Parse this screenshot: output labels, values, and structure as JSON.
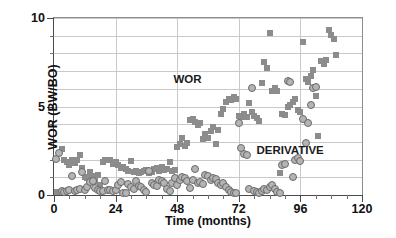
{
  "chart_data": {
    "type": "scatter",
    "title": "",
    "xlabel": "Time (months)",
    "ylabel": "WOR (BW/BO)",
    "xlim": [
      0,
      120
    ],
    "ylim": [
      0,
      10
    ],
    "xticks": [
      0,
      24,
      48,
      72,
      96,
      120
    ],
    "xticklabels": [
      "0",
      "24",
      "48",
      "72",
      "96",
      "120"
    ],
    "xminor_step": 6,
    "yticks": [
      0,
      5,
      10
    ],
    "yticklabels": [
      "0",
      "5",
      "10"
    ],
    "yminor_step": 1,
    "grid": true,
    "grid_axis": "both",
    "legend": "none",
    "annotations": [
      {
        "text": "WOR",
        "x": 52,
        "y": 6.55
      },
      {
        "text": "DERIVATIVE",
        "x": 92,
        "y": 2.55
      }
    ],
    "series": [
      {
        "name": "WOR",
        "marker": "square",
        "color": "#8c8c8c",
        "points": [
          [
            1.0,
            0.18
          ],
          [
            2.0,
            2.35
          ],
          [
            3.0,
            2.6
          ],
          [
            4.0,
            1.95
          ],
          [
            5.0,
            1.85
          ],
          [
            6.0,
            1.7
          ],
          [
            7.0,
            1.98
          ],
          [
            8.0,
            1.8
          ],
          [
            9.0,
            2.0
          ],
          [
            10.0,
            2.25
          ],
          [
            11.0,
            1.55
          ],
          [
            12.0,
            1.0
          ],
          [
            13.0,
            0.95
          ],
          [
            14.0,
            1.3
          ],
          [
            15.0,
            1.05
          ],
          [
            16.0,
            0.8
          ],
          [
            17.0,
            1.15
          ],
          [
            18.0,
            0.55
          ],
          [
            19.0,
            1.85
          ],
          [
            20.0,
            1.95
          ],
          [
            21.0,
            2.0
          ],
          [
            22.0,
            1.95
          ],
          [
            23.0,
            1.75
          ],
          [
            24.0,
            1.85
          ],
          [
            25.0,
            1.7
          ],
          [
            26.0,
            1.55
          ],
          [
            27.0,
            1.6
          ],
          [
            28.0,
            1.45
          ],
          [
            29.0,
            1.35
          ],
          [
            30.0,
            1.9
          ],
          [
            31.0,
            1.3
          ],
          [
            32.0,
            1.35
          ],
          [
            33.0,
            1.25
          ],
          [
            34.0,
            1.3
          ],
          [
            35.0,
            1.35
          ],
          [
            36.0,
            1.4
          ],
          [
            37.0,
            1.25
          ],
          [
            38.0,
            1.3
          ],
          [
            39.0,
            1.45
          ],
          [
            40.0,
            1.5
          ],
          [
            41.0,
            1.35
          ],
          [
            42.0,
            1.6
          ],
          [
            43.0,
            1.4
          ],
          [
            44.0,
            1.45
          ],
          [
            45.0,
            1.85
          ],
          [
            46.0,
            1.35
          ],
          [
            47.0,
            1.4
          ],
          [
            48.0,
            2.7
          ],
          [
            49.0,
            2.9
          ],
          [
            50.0,
            3.2
          ],
          [
            51.0,
            2.75
          ],
          [
            52.0,
            2.95
          ],
          [
            53.0,
            4.25
          ],
          [
            54.0,
            4.3
          ],
          [
            55.0,
            4.1
          ],
          [
            56.0,
            3.95
          ],
          [
            57.0,
            4.05
          ],
          [
            58.0,
            3.15
          ],
          [
            59.0,
            3.45
          ],
          [
            60.0,
            3.2
          ],
          [
            61.0,
            3.6
          ],
          [
            62.0,
            3.85
          ],
          [
            63.0,
            2.9
          ],
          [
            64.0,
            3.7
          ],
          [
            65.0,
            4.6
          ],
          [
            66.0,
            4.85
          ],
          [
            67.0,
            5.25
          ],
          [
            68.0,
            5.45
          ],
          [
            69.0,
            5.35
          ],
          [
            70.0,
            5.55
          ],
          [
            71.0,
            5.4
          ],
          [
            72.0,
            4.45
          ],
          [
            73.0,
            4.4
          ],
          [
            74.0,
            4.55
          ],
          [
            75.0,
            4.4
          ],
          [
            76.0,
            5.2
          ],
          [
            77.0,
            4.7
          ],
          [
            78.0,
            4.45
          ],
          [
            79.0,
            4.35
          ],
          [
            80.0,
            4.2
          ],
          [
            81.0,
            6.35
          ],
          [
            82.0,
            7.5
          ],
          [
            83.0,
            7.2
          ],
          [
            84.0,
            9.15
          ],
          [
            85.0,
            5.85
          ],
          [
            86.0,
            6.05
          ],
          [
            87.0,
            5.9
          ],
          [
            88.0,
            1.25
          ],
          [
            89.0,
            4.55
          ],
          [
            90.0,
            4.5
          ],
          [
            91.0,
            4.95
          ],
          [
            92.0,
            5.1
          ],
          [
            93.0,
            5.25
          ],
          [
            94.0,
            5.4
          ],
          [
            95.0,
            4.8
          ],
          [
            96.0,
            4.7
          ],
          [
            97.0,
            8.65
          ],
          [
            98.0,
            6.55
          ],
          [
            99.0,
            6.4
          ],
          [
            100.0,
            6.75
          ],
          [
            101.0,
            7.05
          ],
          [
            102.0,
            5.6
          ],
          [
            103.0,
            3.35
          ],
          [
            104.0,
            7.55
          ],
          [
            105.0,
            7.4
          ],
          [
            106.0,
            7.65
          ],
          [
            107.0,
            9.35
          ],
          [
            108.0,
            9.05
          ],
          [
            109.0,
            8.8
          ],
          [
            110.0,
            7.9
          ]
        ]
      },
      {
        "name": "DERIVATIVE",
        "marker": "circle",
        "color": "#b4b4b4",
        "edge_color": "#6a6a6a",
        "points": [
          [
            0.8,
            2.05
          ],
          [
            2.0,
            2.35
          ],
          [
            3.0,
            0.2
          ],
          [
            4.0,
            0.18
          ],
          [
            5.0,
            0.22
          ],
          [
            6.0,
            0.3
          ],
          [
            7.0,
            1.05
          ],
          [
            8.0,
            0.25
          ],
          [
            9.0,
            0.3
          ],
          [
            10.0,
            0.35
          ],
          [
            11.0,
            1.3
          ],
          [
            12.0,
            0.3
          ],
          [
            13.0,
            0.45
          ],
          [
            14.0,
            0.75
          ],
          [
            15.0,
            0.8
          ],
          [
            16.0,
            0.4
          ],
          [
            17.0,
            0.3
          ],
          [
            18.0,
            0.2
          ],
          [
            19.0,
            0.25
          ],
          [
            20.0,
            0.8
          ],
          [
            21.0,
            0.3
          ],
          [
            22.0,
            0.28
          ],
          [
            23.0,
            0.22
          ],
          [
            24.0,
            0.3
          ],
          [
            25.0,
            0.55
          ],
          [
            26.0,
            0.75
          ],
          [
            27.0,
            0.12
          ],
          [
            28.0,
            0.1
          ],
          [
            29.0,
            0.6
          ],
          [
            30.0,
            0.45
          ],
          [
            31.0,
            0.35
          ],
          [
            32.0,
            0.8
          ],
          [
            33.0,
            0.5
          ],
          [
            34.0,
            0.45
          ],
          [
            35.0,
            0.3
          ],
          [
            36.0,
            0.15
          ],
          [
            37.0,
            1.35
          ],
          [
            38.0,
            0.7
          ],
          [
            39.0,
            0.55
          ],
          [
            40.0,
            0.5
          ],
          [
            41.0,
            0.85
          ],
          [
            42.0,
            0.8
          ],
          [
            43.0,
            0.65
          ],
          [
            44.0,
            0.35
          ],
          [
            45.0,
            0.2
          ],
          [
            46.0,
            0.7
          ],
          [
            47.0,
            0.95
          ],
          [
            48.0,
            0.55
          ],
          [
            49.0,
            0.85
          ],
          [
            50.0,
            1.0
          ],
          [
            51.0,
            0.95
          ],
          [
            52.0,
            0.8
          ],
          [
            53.0,
            0.4
          ],
          [
            54.0,
            0.85
          ],
          [
            55.0,
            1.45
          ],
          [
            56.0,
            0.7
          ],
          [
            57.0,
            0.75
          ],
          [
            58.0,
            0.6
          ],
          [
            59.0,
            1.15
          ],
          [
            60.0,
            1.05
          ],
          [
            61.0,
            0.85
          ],
          [
            62.0,
            0.95
          ],
          [
            63.0,
            0.9
          ],
          [
            64.0,
            0.65
          ],
          [
            65.0,
            0.55
          ],
          [
            66.0,
            0.7
          ],
          [
            67.0,
            0.45
          ],
          [
            68.0,
            0.3
          ],
          [
            69.0,
            0.15
          ],
          [
            70.0,
            0.12
          ],
          [
            71.0,
            0.1
          ],
          [
            72.0,
            4.05
          ],
          [
            73.0,
            2.65
          ],
          [
            74.0,
            2.3
          ],
          [
            75.0,
            2.25
          ],
          [
            76.0,
            0.35
          ],
          [
            77.0,
            6.05
          ],
          [
            78.0,
            0.2
          ],
          [
            79.0,
            0.15
          ],
          [
            80.0,
            0.12
          ],
          [
            81.0,
            0.22
          ],
          [
            82.0,
            0.35
          ],
          [
            83.0,
            0.3
          ],
          [
            84.0,
            0.45
          ],
          [
            85.0,
            0.55
          ],
          [
            86.0,
            0.35
          ],
          [
            87.0,
            0.18
          ],
          [
            88.0,
            0.12
          ],
          [
            89.0,
            1.7
          ],
          [
            90.0,
            1.75
          ],
          [
            91.0,
            6.45
          ],
          [
            92.0,
            6.4
          ],
          [
            93.0,
            1.0
          ],
          [
            94.0,
            1.95
          ],
          [
            95.0,
            2.1
          ],
          [
            96.0,
            1.9
          ],
          [
            97.0,
            4.3
          ],
          [
            98.0,
            2.95
          ],
          [
            99.0,
            4.05
          ],
          [
            100.0,
            5.1
          ],
          [
            101.0,
            6.05
          ],
          [
            102.0,
            6.1
          ]
        ]
      }
    ]
  }
}
